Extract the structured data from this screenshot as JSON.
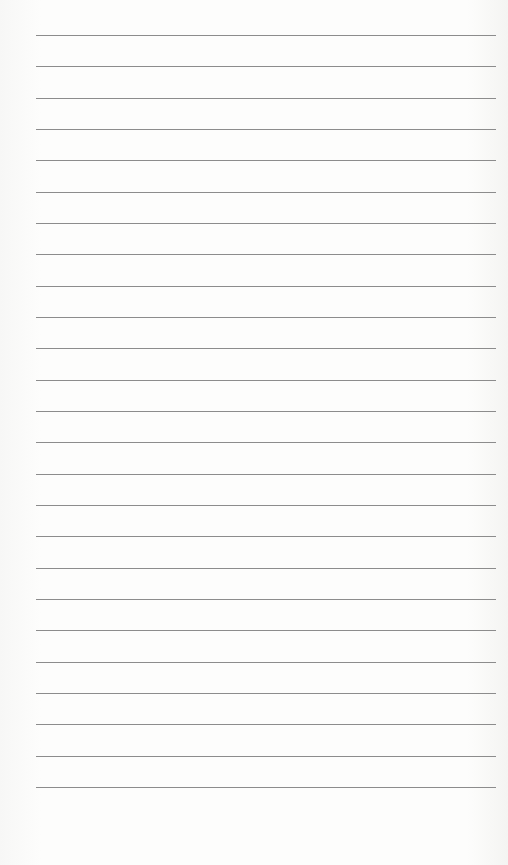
{
  "paper": {
    "type": "lined notebook page",
    "line_count": 25,
    "first_line_y": 35,
    "line_spacing": 31.33,
    "line_left": 36,
    "line_width": 460,
    "line_color": "#8c8c8c",
    "background_color": "#fbfbfa"
  }
}
